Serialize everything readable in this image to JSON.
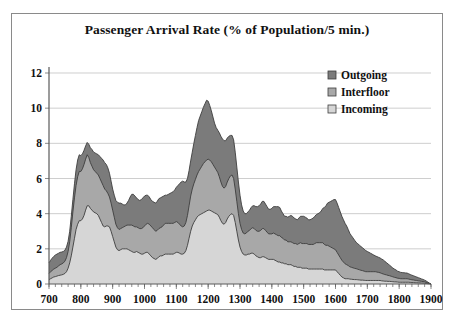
{
  "chart_data": {
    "type": "area",
    "stacked": true,
    "title": "Passenger Arrival Rate (% of Population/5 min.)",
    "xlabel": "",
    "ylabel": "",
    "xlim": [
      700,
      1900
    ],
    "ylim": [
      0,
      12
    ],
    "yticks": [
      0,
      2,
      4,
      6,
      8,
      10,
      12
    ],
    "xticks": [
      700,
      800,
      900,
      1000,
      1100,
      1200,
      1300,
      1400,
      1500,
      1600,
      1700,
      1800,
      1900
    ],
    "xtick_labels": [
      "700",
      "800",
      "900",
      "1000",
      "1100",
      "1200",
      "1300",
      "1400",
      "1500",
      "1600",
      "1700",
      "1800",
      "1900"
    ],
    "ytick_labels": [
      "0",
      "2",
      "4",
      "6",
      "8",
      "10",
      "12"
    ],
    "grid": true,
    "grid_axis": "y",
    "legend_position": "top-right",
    "legend_order_display": [
      "Outgoing",
      "Interfloor",
      "Incoming"
    ],
    "colors": {
      "Outgoing": "#7b7b7b",
      "Interfloor": "#a8a8a8",
      "Incoming": "#d6d6d6",
      "outline": "#3d3d3d",
      "grid": "#b9b9b9",
      "axis": "#5a5a5a",
      "frame": "#8a8a8a",
      "background": "#ffffff",
      "text": "#111111"
    },
    "x": [
      700,
      705,
      710,
      715,
      720,
      725,
      730,
      735,
      740,
      745,
      750,
      755,
      760,
      765,
      770,
      775,
      780,
      785,
      790,
      795,
      800,
      805,
      810,
      815,
      820,
      825,
      830,
      835,
      840,
      845,
      850,
      855,
      860,
      865,
      870,
      875,
      880,
      885,
      890,
      895,
      900,
      905,
      910,
      915,
      920,
      925,
      930,
      935,
      940,
      945,
      950,
      955,
      960,
      965,
      970,
      975,
      980,
      985,
      990,
      995,
      1000,
      1005,
      1010,
      1015,
      1020,
      1025,
      1030,
      1035,
      1040,
      1045,
      1050,
      1055,
      1060,
      1065,
      1070,
      1075,
      1080,
      1085,
      1090,
      1095,
      1100,
      1105,
      1110,
      1115,
      1120,
      1125,
      1130,
      1135,
      1140,
      1145,
      1150,
      1155,
      1160,
      1165,
      1170,
      1175,
      1180,
      1185,
      1190,
      1195,
      1200,
      1205,
      1210,
      1215,
      1220,
      1225,
      1230,
      1235,
      1240,
      1245,
      1250,
      1255,
      1260,
      1265,
      1270,
      1275,
      1280,
      1285,
      1290,
      1295,
      1300,
      1305,
      1310,
      1315,
      1320,
      1325,
      1330,
      1335,
      1340,
      1345,
      1350,
      1355,
      1360,
      1365,
      1370,
      1375,
      1380,
      1385,
      1390,
      1395,
      1400,
      1405,
      1410,
      1415,
      1420,
      1425,
      1430,
      1435,
      1440,
      1445,
      1450,
      1455,
      1460,
      1465,
      1470,
      1475,
      1480,
      1485,
      1490,
      1495,
      1500,
      1505,
      1510,
      1515,
      1520,
      1525,
      1530,
      1535,
      1540,
      1545,
      1550,
      1555,
      1560,
      1565,
      1570,
      1575,
      1580,
      1585,
      1590,
      1595,
      1600,
      1605,
      1610,
      1615,
      1620,
      1625,
      1630,
      1635,
      1640,
      1645,
      1650,
      1655,
      1660,
      1665,
      1670,
      1675,
      1680,
      1685,
      1690,
      1695,
      1700,
      1705,
      1710,
      1715,
      1720,
      1725,
      1730,
      1735,
      1740,
      1745,
      1750,
      1755,
      1760,
      1765,
      1770,
      1775,
      1780,
      1785,
      1790,
      1795,
      1800,
      1805,
      1810,
      1815,
      1820,
      1825,
      1830,
      1835,
      1840,
      1845,
      1850,
      1855,
      1860,
      1865,
      1870,
      1875,
      1880,
      1885,
      1890,
      1895,
      1900
    ],
    "series": [
      {
        "name": "Incoming",
        "stack_position": 1,
        "values": [
          0.25,
          0.3,
          0.35,
          0.4,
          0.42,
          0.45,
          0.48,
          0.5,
          0.52,
          0.55,
          0.6,
          0.7,
          0.9,
          1.2,
          1.6,
          2.1,
          2.6,
          3.1,
          3.4,
          3.6,
          3.6,
          3.7,
          3.9,
          4.2,
          4.45,
          4.45,
          4.3,
          4.2,
          4.1,
          4.05,
          4.0,
          3.9,
          3.7,
          3.5,
          3.3,
          3.25,
          3.3,
          3.3,
          3.25,
          3.0,
          2.7,
          2.4,
          2.1,
          1.95,
          1.9,
          1.95,
          2.0,
          2.0,
          2.0,
          2.0,
          1.95,
          1.9,
          1.85,
          1.8,
          1.8,
          1.85,
          1.8,
          1.75,
          1.7,
          1.7,
          1.75,
          1.8,
          1.8,
          1.7,
          1.6,
          1.5,
          1.45,
          1.4,
          1.45,
          1.55,
          1.6,
          1.6,
          1.65,
          1.7,
          1.7,
          1.7,
          1.7,
          1.7,
          1.7,
          1.75,
          1.8,
          1.8,
          1.75,
          1.7,
          1.7,
          1.75,
          1.9,
          2.2,
          2.6,
          3.0,
          3.3,
          3.5,
          3.65,
          3.8,
          3.9,
          3.95,
          4.0,
          4.05,
          4.1,
          4.15,
          4.2,
          4.2,
          4.15,
          4.1,
          4.05,
          4.0,
          3.95,
          3.8,
          3.6,
          3.45,
          3.4,
          3.5,
          3.7,
          3.85,
          3.95,
          4.0,
          3.9,
          3.5,
          3.0,
          2.5,
          2.1,
          1.85,
          1.7,
          1.65,
          1.65,
          1.7,
          1.7,
          1.75,
          1.75,
          1.7,
          1.6,
          1.55,
          1.5,
          1.5,
          1.55,
          1.55,
          1.5,
          1.45,
          1.4,
          1.4,
          1.4,
          1.4,
          1.35,
          1.3,
          1.25,
          1.25,
          1.2,
          1.2,
          1.15,
          1.15,
          1.1,
          1.1,
          1.1,
          1.05,
          1.0,
          1.0,
          0.95,
          0.95,
          0.95,
          0.9,
          0.9,
          0.9,
          0.9,
          0.85,
          0.85,
          0.85,
          0.85,
          0.85,
          0.85,
          0.85,
          0.85,
          0.85,
          0.85,
          0.8,
          0.8,
          0.8,
          0.8,
          0.8,
          0.8,
          0.8,
          0.8,
          0.7,
          0.6,
          0.5,
          0.4,
          0.35,
          0.3,
          0.3,
          0.3,
          0.28,
          0.27,
          0.26,
          0.25,
          0.25,
          0.24,
          0.23,
          0.22,
          0.22,
          0.21,
          0.2,
          0.2,
          0.2,
          0.2,
          0.2,
          0.2,
          0.2,
          0.2,
          0.2,
          0.2,
          0.18,
          0.17,
          0.16,
          0.16,
          0.15,
          0.15,
          0.14,
          0.13,
          0.12,
          0.12,
          0.11,
          0.1,
          0.1,
          0.1,
          0.1,
          0.1,
          0.1,
          0.1,
          0.09,
          0.08,
          0.08,
          0.07,
          0.07,
          0.06,
          0.06,
          0.05,
          0.05,
          0.04,
          0.03,
          0.02,
          0.01,
          0.0
        ]
      },
      {
        "name": "Interfloor",
        "stack_position": 2,
        "values": [
          0.35,
          0.4,
          0.42,
          0.45,
          0.48,
          0.5,
          0.55,
          0.6,
          0.62,
          0.65,
          0.7,
          0.8,
          0.95,
          1.2,
          1.6,
          2.0,
          2.3,
          2.5,
          2.7,
          2.8,
          2.8,
          2.85,
          2.9,
          2.9,
          2.9,
          2.75,
          2.6,
          2.5,
          2.4,
          2.35,
          2.3,
          2.3,
          2.3,
          2.3,
          2.3,
          2.15,
          2.0,
          1.85,
          1.7,
          1.6,
          1.5,
          1.4,
          1.3,
          1.25,
          1.2,
          1.2,
          1.2,
          1.25,
          1.3,
          1.35,
          1.4,
          1.45,
          1.5,
          1.5,
          1.45,
          1.4,
          1.4,
          1.4,
          1.45,
          1.5,
          1.55,
          1.6,
          1.65,
          1.7,
          1.7,
          1.7,
          1.65,
          1.6,
          1.6,
          1.6,
          1.6,
          1.65,
          1.7,
          1.75,
          1.75,
          1.75,
          1.75,
          1.75,
          1.75,
          1.75,
          1.75,
          1.7,
          1.65,
          1.6,
          1.55,
          1.55,
          1.6,
          1.7,
          1.85,
          2.0,
          2.1,
          2.2,
          2.3,
          2.4,
          2.5,
          2.6,
          2.7,
          2.8,
          2.85,
          2.9,
          2.9,
          2.85,
          2.8,
          2.7,
          2.6,
          2.5,
          2.4,
          2.3,
          2.2,
          2.1,
          2.05,
          2.05,
          2.1,
          2.15,
          2.2,
          2.2,
          2.1,
          1.9,
          1.7,
          1.5,
          1.35,
          1.25,
          1.2,
          1.2,
          1.25,
          1.3,
          1.35,
          1.4,
          1.45,
          1.45,
          1.45,
          1.45,
          1.5,
          1.55,
          1.6,
          1.6,
          1.55,
          1.5,
          1.45,
          1.45,
          1.45,
          1.5,
          1.5,
          1.5,
          1.5,
          1.5,
          1.45,
          1.4,
          1.35,
          1.35,
          1.3,
          1.3,
          1.3,
          1.3,
          1.3,
          1.3,
          1.3,
          1.35,
          1.4,
          1.4,
          1.4,
          1.4,
          1.4,
          1.4,
          1.4,
          1.4,
          1.4,
          1.45,
          1.5,
          1.5,
          1.5,
          1.5,
          1.5,
          1.45,
          1.4,
          1.4,
          1.35,
          1.3,
          1.25,
          1.2,
          1.15,
          1.1,
          1.05,
          1.0,
          0.95,
          0.9,
          0.85,
          0.8,
          0.75,
          0.7,
          0.68,
          0.66,
          0.64,
          0.62,
          0.6,
          0.58,
          0.56,
          0.54,
          0.52,
          0.5,
          0.5,
          0.5,
          0.5,
          0.5,
          0.5,
          0.5,
          0.48,
          0.46,
          0.44,
          0.42,
          0.4,
          0.38,
          0.36,
          0.34,
          0.32,
          0.3,
          0.28,
          0.26,
          0.24,
          0.22,
          0.22,
          0.2,
          0.2,
          0.2,
          0.2,
          0.2,
          0.18,
          0.17,
          0.16,
          0.15,
          0.14,
          0.13,
          0.12,
          0.11,
          0.1,
          0.09,
          0.08,
          0.06,
          0.04,
          0.02,
          0.0
        ]
      },
      {
        "name": "Outgoing",
        "stack_position": 3,
        "values": [
          0.6,
          0.65,
          0.7,
          0.72,
          0.75,
          0.75,
          0.72,
          0.7,
          0.68,
          0.65,
          0.62,
          0.6,
          0.58,
          0.6,
          0.65,
          0.7,
          0.8,
          0.9,
          0.95,
          0.95,
          0.9,
          0.85,
          0.8,
          0.75,
          0.7,
          0.75,
          0.85,
          0.95,
          1.0,
          1.05,
          1.1,
          1.15,
          1.25,
          1.35,
          1.45,
          1.5,
          1.5,
          1.45,
          1.35,
          1.25,
          1.2,
          1.25,
          1.35,
          1.45,
          1.5,
          1.45,
          1.35,
          1.25,
          1.2,
          1.25,
          1.4,
          1.6,
          1.75,
          1.8,
          1.75,
          1.65,
          1.6,
          1.6,
          1.65,
          1.7,
          1.7,
          1.65,
          1.6,
          1.55,
          1.5,
          1.5,
          1.55,
          1.6,
          1.65,
          1.7,
          1.7,
          1.7,
          1.65,
          1.6,
          1.6,
          1.65,
          1.7,
          1.75,
          1.8,
          1.85,
          1.95,
          2.1,
          2.3,
          2.5,
          2.6,
          2.5,
          2.3,
          2.1,
          2.0,
          2.0,
          2.1,
          2.3,
          2.5,
          2.7,
          2.9,
          3.0,
          3.1,
          3.2,
          3.3,
          3.4,
          3.3,
          3.1,
          2.9,
          2.7,
          2.5,
          2.4,
          2.4,
          2.5,
          2.6,
          2.7,
          2.7,
          2.6,
          2.5,
          2.4,
          2.3,
          2.25,
          2.2,
          2.1,
          1.95,
          1.8,
          1.6,
          1.4,
          1.25,
          1.15,
          1.1,
          1.1,
          1.15,
          1.2,
          1.25,
          1.3,
          1.35,
          1.4,
          1.45,
          1.5,
          1.55,
          1.55,
          1.5,
          1.45,
          1.4,
          1.4,
          1.45,
          1.5,
          1.55,
          1.6,
          1.65,
          1.6,
          1.5,
          1.4,
          1.35,
          1.35,
          1.4,
          1.45,
          1.5,
          1.5,
          1.45,
          1.4,
          1.4,
          1.45,
          1.5,
          1.55,
          1.55,
          1.5,
          1.45,
          1.4,
          1.4,
          1.45,
          1.5,
          1.55,
          1.6,
          1.65,
          1.7,
          1.8,
          1.95,
          2.1,
          2.25,
          2.4,
          2.5,
          2.6,
          2.7,
          2.8,
          2.85,
          2.8,
          2.7,
          2.6,
          2.5,
          2.4,
          2.3,
          2.2,
          2.05,
          1.9,
          1.8,
          1.7,
          1.6,
          1.5,
          1.45,
          1.4,
          1.35,
          1.3,
          1.25,
          1.2,
          1.15,
          1.1,
          1.05,
          1.0,
          0.95,
          0.9,
          0.88,
          0.86,
          0.84,
          0.82,
          0.8,
          0.75,
          0.7,
          0.65,
          0.6,
          0.55,
          0.5,
          0.47,
          0.44,
          0.4,
          0.38,
          0.36,
          0.35,
          0.34,
          0.33,
          0.32,
          0.3,
          0.28,
          0.26,
          0.24,
          0.22,
          0.2,
          0.18,
          0.16,
          0.14,
          0.12,
          0.1,
          0.08,
          0.05,
          0.02,
          0.0
        ]
      }
    ]
  },
  "legend": [
    {
      "label": "Outgoing",
      "color": "#7b7b7b"
    },
    {
      "label": "Interfloor",
      "color": "#a8a8a8"
    },
    {
      "label": "Incoming",
      "color": "#d6d6d6"
    }
  ]
}
